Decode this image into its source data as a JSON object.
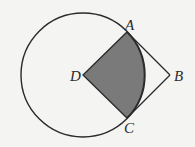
{
  "diagram": {
    "circle": {
      "cx": 83,
      "cy": 75,
      "r": 62
    },
    "points": {
      "A": {
        "label": "A",
        "x": 127,
        "y": 32
      },
      "B": {
        "label": "B",
        "x": 170,
        "y": 75
      },
      "C": {
        "label": "C",
        "x": 127,
        "y": 118
      },
      "D": {
        "label": "D",
        "x": 83,
        "y": 75
      }
    },
    "shaded_region": "sector DAC",
    "colors": {
      "background": "#f4f4f2",
      "stroke": "#2a2a2a",
      "shade": "#7a7a7a"
    }
  }
}
